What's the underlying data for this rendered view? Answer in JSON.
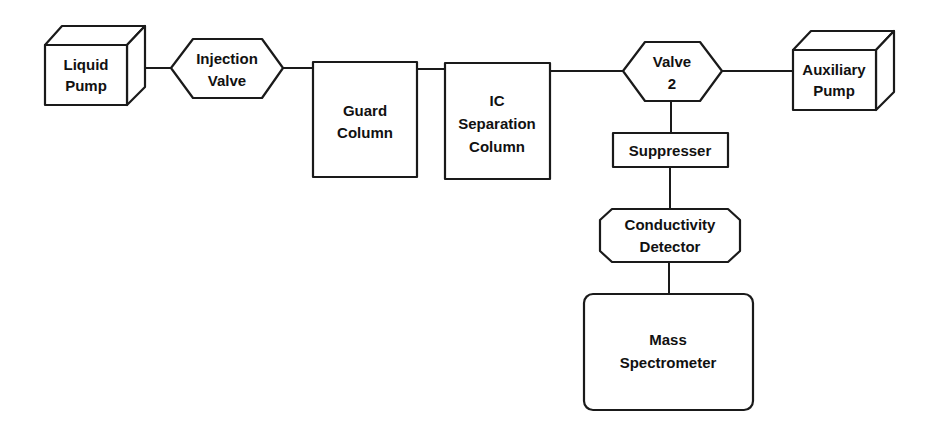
{
  "diagram": {
    "type": "ion-chromatography-mass-spectrometry-flow",
    "nodes": [
      {
        "id": "liquid_pump",
        "shape": "cube",
        "lines": [
          "Liquid",
          "Pump"
        ]
      },
      {
        "id": "injection_valve",
        "shape": "hexagon",
        "lines": [
          "Injection",
          "Valve"
        ]
      },
      {
        "id": "guard_column",
        "shape": "rectangle",
        "lines": [
          "Guard",
          "Column"
        ]
      },
      {
        "id": "ic_separation_column",
        "shape": "rectangle",
        "lines": [
          "IC",
          "Separation",
          "Column"
        ]
      },
      {
        "id": "valve_2",
        "shape": "hexagon",
        "lines": [
          "Valve",
          "2"
        ]
      },
      {
        "id": "auxiliary_pump",
        "shape": "cube",
        "lines": [
          "Auxiliary",
          "Pump"
        ]
      },
      {
        "id": "suppresser",
        "shape": "rectangle",
        "lines": [
          "Suppresser"
        ]
      },
      {
        "id": "conductivity_detector",
        "shape": "octagon",
        "lines": [
          "Conductivity",
          "Detector"
        ]
      },
      {
        "id": "mass_spectrometer",
        "shape": "rounded-rectangle",
        "lines": [
          "Mass",
          "Spectrometer"
        ]
      }
    ],
    "edges": [
      {
        "from": "liquid_pump",
        "to": "injection_valve"
      },
      {
        "from": "injection_valve",
        "to": "guard_column"
      },
      {
        "from": "guard_column",
        "to": "ic_separation_column"
      },
      {
        "from": "ic_separation_column",
        "to": "valve_2"
      },
      {
        "from": "valve_2",
        "to": "auxiliary_pump"
      },
      {
        "from": "valve_2",
        "to": "suppresser"
      },
      {
        "from": "suppresser",
        "to": "conductivity_detector"
      },
      {
        "from": "conductivity_detector",
        "to": "mass_spectrometer"
      }
    ]
  },
  "labels": {
    "liquid_pump": {
      "l1": "Liquid",
      "l2": "Pump"
    },
    "injection_valve": {
      "l1": "Injection",
      "l2": "Valve"
    },
    "guard_column": {
      "l1": "Guard",
      "l2": "Column"
    },
    "ic_separation_column": {
      "l1": "IC",
      "l2": "Separation",
      "l3": "Column"
    },
    "valve_2": {
      "l1": "Valve",
      "l2": "2"
    },
    "auxiliary_pump": {
      "l1": "Auxiliary",
      "l2": "Pump"
    },
    "suppresser": {
      "l1": "Suppresser"
    },
    "conductivity_detector": {
      "l1": "Conductivity",
      "l2": "Detector"
    },
    "mass_spectrometer": {
      "l1": "Mass",
      "l2": "Spectrometer"
    }
  },
  "colors": {
    "stroke": "#1a1a1a",
    "fill": "#ffffff",
    "text": "#111111",
    "background": "#ffffff"
  }
}
